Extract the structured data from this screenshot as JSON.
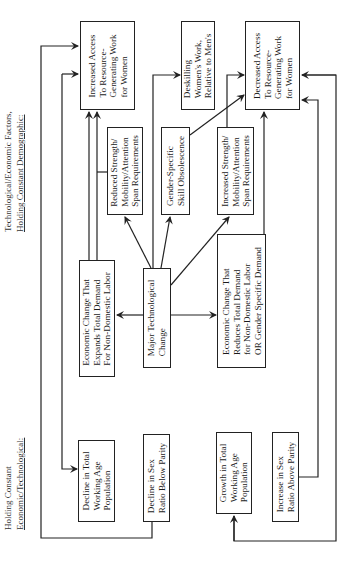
{
  "headers": {
    "left_line1": "Holding Constant",
    "left_line2": "Economic/Technological:",
    "right_line1": "Technological/Economic Factors,",
    "right_line2": "Holding Constant Demographic:"
  },
  "boxes": {
    "increased_access": "Increased Access\nTo Resource-\nGenerating Work\nfor Women",
    "deskilling": "Deskilling\nWomen's Work,\nRelative to Men's",
    "decreased_access": "Decreased Access\nTo Resource-\nGenerating Work\nfor Women",
    "reduced_strength": "Reduced Strength/\nMobility/Attention\nSpan Requirements",
    "gender_specific": "Gender-Specific\nSkill Obsolescence",
    "increased_strength": "Increased Strength/\nMobility/Attention\nSpan Requirements",
    "econ_expands": "Economic Change That\nExpands Total Demand\nFor Non-Domestic Labor",
    "major_tech": "Major Technological\nChange",
    "econ_reduces": "Economic Change That\nReduces Total Demand\nfor Non-Domestic Labor\nOR Gender Specific Demand",
    "decline_total": "Decline in Total\nWorking Age\nPopulation",
    "decline_sex": "Decline in Sex\nRatio Below Parity",
    "growth_total": "Growth in Total\nWorking Age\nPopulation",
    "increase_sex": "Increase in Sex\nRatio Above Parity"
  },
  "colors": {
    "line": "#222222",
    "background": "#ffffff"
  }
}
